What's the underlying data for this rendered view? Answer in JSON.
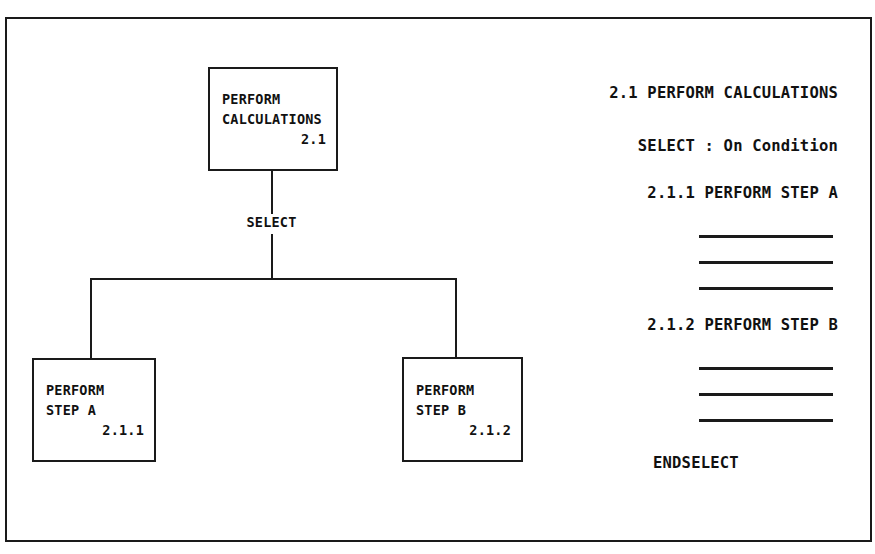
{
  "diagram": {
    "background_color": "#ffffff",
    "line_color": "#1a1a1a",
    "text_color": "#111111"
  },
  "tree": {
    "root_box": {
      "line1": "PERFORM",
      "line2": "CALCULATIONS",
      "number": "2.1"
    },
    "connector_label": "SELECT",
    "children": [
      {
        "line1": "PERFORM",
        "line2": "STEP A",
        "number": "2.1.1"
      },
      {
        "line1": "PERFORM",
        "line2": "STEP B",
        "number": "2.1.2"
      }
    ]
  },
  "pseudocode": {
    "lines": [
      {
        "text": "2.1 PERFORM CALCULATIONS"
      },
      {
        "text": "SELECT : On Condition"
      },
      {
        "text": "2.1.1 PERFORM STEP A"
      },
      {
        "text": "2.1.2 PERFORM STEP B"
      },
      {
        "text": "ENDSELECT"
      }
    ],
    "rule_count_first_group": 3,
    "rule_count_second_group": 3
  }
}
